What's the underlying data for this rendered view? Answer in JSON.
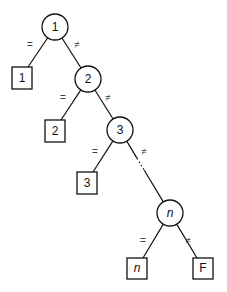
{
  "diagram": {
    "type": "decision-tree",
    "edge_labels": {
      "equal": "=",
      "not_equal": "≠"
    },
    "circles": [
      {
        "id": "c1",
        "label": "1",
        "cx": 55,
        "cy": 27,
        "r": 13,
        "italic": false
      },
      {
        "id": "c2",
        "label": "2",
        "cx": 88,
        "cy": 79,
        "r": 13,
        "italic": false
      },
      {
        "id": "c3",
        "label": "3",
        "cx": 120,
        "cy": 130,
        "r": 13,
        "italic": false
      },
      {
        "id": "cn",
        "label": "n",
        "cx": 170,
        "cy": 213,
        "r": 13,
        "italic": true
      }
    ],
    "boxes": [
      {
        "id": "b1",
        "label": "1",
        "x": 12,
        "y": 67,
        "w": 20,
        "h": 22,
        "italic": false
      },
      {
        "id": "b2",
        "label": "2",
        "x": 45,
        "y": 120,
        "w": 20,
        "h": 22,
        "italic": false
      },
      {
        "id": "b3",
        "label": "3",
        "x": 77,
        "y": 172,
        "w": 20,
        "h": 22,
        "italic": false
      },
      {
        "id": "bn",
        "label": "n",
        "x": 127,
        "y": 258,
        "w": 20,
        "h": 21,
        "italic": true
      },
      {
        "id": "bF",
        "label": "F",
        "x": 193,
        "y": 258,
        "w": 20,
        "h": 21,
        "italic": false
      }
    ],
    "edges": [
      {
        "from": "c1",
        "to": "b1",
        "label": "=",
        "label_x": 30,
        "label_y": 45
      },
      {
        "from": "c1",
        "to": "c2",
        "label": "≠",
        "label_x": 77,
        "label_y": 45
      },
      {
        "from": "c2",
        "to": "b2",
        "label": "=",
        "label_x": 63,
        "label_y": 98
      },
      {
        "from": "c2",
        "to": "c3",
        "label": "≠",
        "label_x": 108,
        "label_y": 98
      },
      {
        "from": "c3",
        "to": "b3",
        "label": "=",
        "label_x": 95,
        "label_y": 152
      },
      {
        "from": "c3",
        "to": "cn",
        "label": "≠",
        "label_x": 144,
        "label_y": 152,
        "dotted_segment": true
      },
      {
        "from": "cn",
        "to": "bn",
        "label": "=",
        "label_x": 143,
        "label_y": 241
      },
      {
        "from": "cn",
        "to": "bF",
        "label": "≠",
        "label_x": 188,
        "label_y": 241
      }
    ]
  }
}
